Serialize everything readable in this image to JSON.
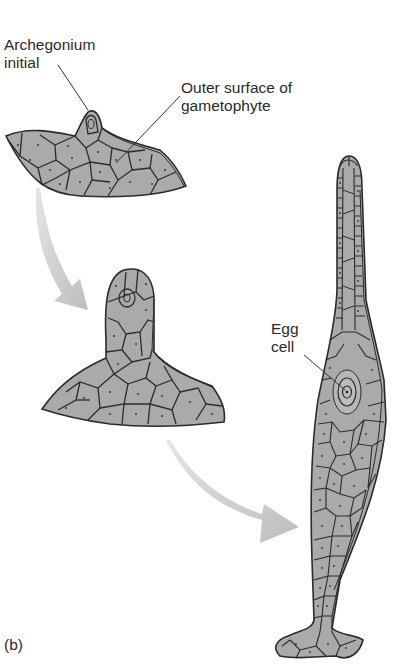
{
  "figure": {
    "panel_label": "(b)",
    "stages": [
      {
        "name": "stage-1",
        "description": "Archegonium initial on gametophyte surface"
      },
      {
        "name": "stage-2",
        "description": "Developing archegonium neck"
      },
      {
        "name": "stage-3",
        "description": "Mature archegonium with egg cell"
      }
    ],
    "labels": {
      "archegonium_initial_line1": "Archegonium",
      "archegonium_initial_line2": "initial",
      "outer_surface_line1": "Outer surface of",
      "outer_surface_line2": "gametophyte",
      "egg_cell_line1": "Egg",
      "egg_cell_line2": "cell"
    },
    "colors": {
      "tissue_fill": "#a9a9a9",
      "cell_wall": "#2b2b2b",
      "arrow": "#c4c4c4",
      "background": "#ffffff"
    }
  }
}
